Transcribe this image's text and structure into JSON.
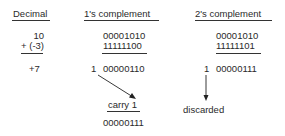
{
  "headers": {
    "decimal": "Decimal",
    "ones": "1's complement",
    "twos": "2's complement"
  },
  "decimal": {
    "operand1": "10",
    "operand2": "+ (-3)",
    "result": "+7"
  },
  "ones_complement": {
    "operand1": "00001010",
    "operand2": "11111100",
    "carry_bit": "1",
    "sum": "00000110",
    "carry_label": "carry 1",
    "final": "00000111"
  },
  "twos_complement": {
    "operand1": "00001010",
    "operand2": "11111101",
    "carry_bit": "1",
    "sum": "00000111",
    "discard_label": "discarded"
  }
}
